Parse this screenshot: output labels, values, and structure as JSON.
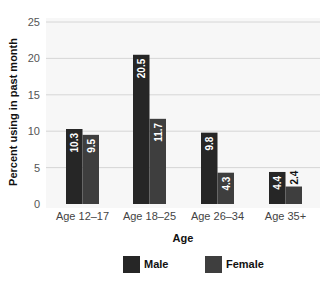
{
  "chart_data": {
    "type": "bar",
    "title": "",
    "xlabel": "Age",
    "ylabel": "Percent using in past month",
    "categories": [
      "Age 12–17",
      "Age 18–25",
      "Age 26–34",
      "Age 35+"
    ],
    "series": [
      {
        "name": "Male",
        "color": "#262626",
        "values": [
          10.3,
          20.5,
          9.8,
          4.4
        ]
      },
      {
        "name": "Female",
        "color": "#3e3e3e",
        "values": [
          9.5,
          11.7,
          4.3,
          2.4
        ]
      }
    ],
    "ylim": [
      0,
      25
    ],
    "yticks": [
      0,
      5,
      10,
      15,
      20,
      25
    ],
    "grid": true,
    "legend_position": "bottom",
    "data_labels": true
  },
  "colors": {
    "plot_background": "#f7f7f7",
    "gridline": "#d6d6d6"
  }
}
